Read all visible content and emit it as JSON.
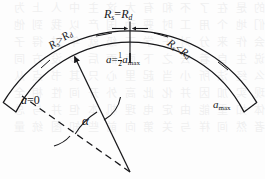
{
  "figure": {
    "background_color": "#fdfdfd",
    "ink_color": "#17171a",
    "bleed_color": "#8d8d93",
    "bleedthrough_rows": [
      "的 是 在 了 不 和 有 大 这 主 中 人 上 为",
      "们 地 个 用 工 时 要 动 国 产 以 我 到 他",
      "会 作 来 分 对 于 学 下 级 就 年 过 得 子",
      "说 生 自 着 去 之 下 面 而 后 多 没 方 同",
      "么 经 法 所 小 当 起 里 心 只 其 书 点 从",
      "现 实 加 因 并 化 此 高 外 开 间 性 相 全",
      "体 如 重 能 由 定 电 理 机 本 但 并 与 总",
      "者 然 间 样 与 关 第 向 前 些 知 图 统 量"
    ],
    "labels": {
      "top_center_relation": {
        "lead": "R",
        "lead_sub": "s",
        "operator": "=",
        "trail": "R",
        "trail_sub": "d"
      },
      "left_arc_relation": {
        "lead": "R",
        "lead_sub": "s",
        "operator": ">",
        "trail": "R",
        "trail_sub": "d"
      },
      "right_arc_relation": {
        "lead": "R",
        "lead_sub": "s",
        "operator": "<",
        "trail": "R",
        "trail_sub": "d"
      },
      "mid_value": {
        "var": "a",
        "operator": "=",
        "num": "1",
        "den": "2",
        "term": "a",
        "term_sub": "max"
      },
      "left_value": {
        "var": "a",
        "operator": "=",
        "value": "0"
      },
      "right_value": {
        "var": "a",
        "sub": "max"
      },
      "angle": {
        "symbol": "α"
      }
    },
    "geometry": {
      "vertex": {
        "x": 130,
        "y": 172
      },
      "outer_radius": 148,
      "inner_radius": 128,
      "angle_start_deg": 208,
      "angle_end_deg": 332,
      "stroke_width": 1.25
    }
  }
}
